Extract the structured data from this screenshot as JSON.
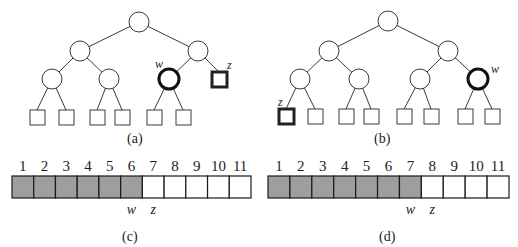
{
  "colors": {
    "filled_cell": "#9e9e9e",
    "empty_cell": "#ffffff",
    "stroke": "#222222"
  },
  "panels": {
    "a": {
      "caption": "(a)",
      "tree": {
        "w_label": "w",
        "z_label": "z",
        "description": "complete binary tree; w is an internal node at depth 2 (right subtree), z is an external node at depth 2"
      }
    },
    "b": {
      "caption": "(b)",
      "tree": {
        "w_label": "w",
        "z_label": "z",
        "description": "complete binary tree; w is rightmost node at depth 2, z is leftmost external node at depth 3"
      }
    },
    "c": {
      "caption": "(c)",
      "array": {
        "indices": [
          "1",
          "2",
          "3",
          "4",
          "5",
          "6",
          "7",
          "8",
          "9",
          "10",
          "11"
        ],
        "filled_count": 6,
        "w_label": "w",
        "w_index": 6,
        "z_label": "z",
        "z_index": 7
      }
    },
    "d": {
      "caption": "(d)",
      "array": {
        "indices": [
          "1",
          "2",
          "3",
          "4",
          "5",
          "6",
          "7",
          "8",
          "9",
          "10",
          "11"
        ],
        "filled_count": 7,
        "w_label": "w",
        "w_index": 7,
        "z_label": "z",
        "z_index": 8
      }
    }
  }
}
